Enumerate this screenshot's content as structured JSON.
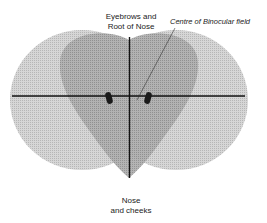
{
  "diagram": {
    "labels": {
      "top_line1": "Eyebrows and",
      "top_line2": "Root of Nose",
      "centre": "Centre of Binocular field",
      "bottom_line1": "Nose",
      "bottom_line2": "and cheeks"
    },
    "colors": {
      "monocular_field": "#c8c8c8",
      "binocular_field": "#a4a4a4",
      "axis_line": "#111111",
      "eye_marker": "#1a1a1a",
      "background": "#ffffff"
    }
  }
}
